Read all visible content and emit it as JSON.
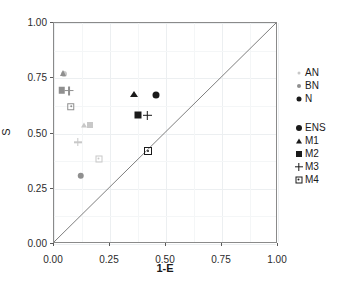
{
  "chart_data": {
    "type": "scatter",
    "title": "",
    "xlabel": "1-E",
    "ylabel": "S",
    "xlim": [
      0.0,
      1.0
    ],
    "ylim": [
      0.0,
      1.0
    ],
    "xticks": [
      "0.00",
      "0.25",
      "0.50",
      "0.75",
      "1.00"
    ],
    "xtick_values": [
      0.0,
      0.25,
      0.5,
      0.75,
      1.0
    ],
    "yticks": [
      "0.00",
      "0.25",
      "0.50",
      "0.75",
      "1.00"
    ],
    "ytick_values": [
      0.0,
      0.25,
      0.5,
      0.75,
      1.0
    ],
    "grid": true,
    "legend_position": "right",
    "reference_line": {
      "name": "one-to-one-line",
      "from": [
        0.0,
        0.0
      ],
      "to": [
        1.0,
        1.0
      ]
    },
    "color_groups": [
      {
        "name": "AN",
        "color": "#c8c8c8"
      },
      {
        "name": "BN",
        "color": "#8f8f8f"
      },
      {
        "name": "N",
        "color": "#1a1a1a"
      }
    ],
    "shape_groups": [
      {
        "name": "ENS",
        "marker": "circle"
      },
      {
        "name": "M1",
        "marker": "triangle"
      },
      {
        "name": "M2",
        "marker": "square"
      },
      {
        "name": "M3",
        "marker": "plus"
      },
      {
        "name": "M4",
        "marker": "square-dot"
      }
    ],
    "points": [
      {
        "group": "AN",
        "model": "ENS",
        "marker": "circle",
        "color": "#c8c8c8",
        "x": 0.045,
        "y": 0.77
      },
      {
        "group": "AN",
        "model": "M1",
        "marker": "triangle",
        "color": "#c8c8c8",
        "x": 0.135,
        "y": 0.54
      },
      {
        "group": "AN",
        "model": "M2",
        "marker": "square",
        "color": "#c8c8c8",
        "x": 0.16,
        "y": 0.54
      },
      {
        "group": "AN",
        "model": "M3",
        "marker": "plus",
        "color": "#c8c8c8",
        "x": 0.105,
        "y": 0.46
      },
      {
        "group": "AN",
        "model": "M4",
        "marker": "square-dot",
        "color": "#c8c8c8",
        "x": 0.2,
        "y": 0.385
      },
      {
        "group": "BN",
        "model": "ENS",
        "marker": "circle",
        "color": "#8f8f8f",
        "x": 0.12,
        "y": 0.31
      },
      {
        "group": "BN",
        "model": "M1",
        "marker": "triangle",
        "color": "#8f8f8f",
        "x": 0.04,
        "y": 0.772
      },
      {
        "group": "BN",
        "model": "M2",
        "marker": "square",
        "color": "#8f8f8f",
        "x": 0.035,
        "y": 0.695
      },
      {
        "group": "BN",
        "model": "M3",
        "marker": "plus",
        "color": "#8f8f8f",
        "x": 0.068,
        "y": 0.693
      },
      {
        "group": "BN",
        "model": "M4",
        "marker": "square-dot",
        "color": "#8f8f8f",
        "x": 0.075,
        "y": 0.622
      },
      {
        "group": "N",
        "model": "ENS",
        "marker": "circle",
        "color": "#1a1a1a",
        "x": 0.455,
        "y": 0.675
      },
      {
        "group": "N",
        "model": "M1",
        "marker": "triangle",
        "color": "#1a1a1a",
        "x": 0.355,
        "y": 0.68
      },
      {
        "group": "N",
        "model": "M2",
        "marker": "square",
        "color": "#1a1a1a",
        "x": 0.375,
        "y": 0.583
      },
      {
        "group": "N",
        "model": "M3",
        "marker": "plus",
        "color": "#1a1a1a",
        "x": 0.418,
        "y": 0.583
      },
      {
        "group": "N",
        "model": "M4",
        "marker": "square-dot",
        "color": "#1a1a1a",
        "x": 0.42,
        "y": 0.422
      }
    ]
  },
  "axes": {
    "y_label": "S",
    "x_label": "1-E"
  },
  "legend": {
    "group_a": [
      {
        "label": "AN",
        "marker": "circle",
        "color": "#c8c8c8",
        "size": 3
      },
      {
        "label": "BN",
        "marker": "circle",
        "color": "#8f8f8f",
        "size": 4
      },
      {
        "label": "N",
        "marker": "circle",
        "color": "#1a1a1a",
        "size": 5
      }
    ],
    "group_b": [
      {
        "label": "ENS",
        "marker": "circle",
        "color": "#1a1a1a"
      },
      {
        "label": "M1",
        "marker": "triangle",
        "color": "#1a1a1a"
      },
      {
        "label": "M2",
        "marker": "square",
        "color": "#1a1a1a"
      },
      {
        "label": "M3",
        "marker": "plus",
        "color": "#1a1a1a"
      },
      {
        "label": "M4",
        "marker": "square-dot",
        "color": "#1a1a1a"
      }
    ]
  }
}
